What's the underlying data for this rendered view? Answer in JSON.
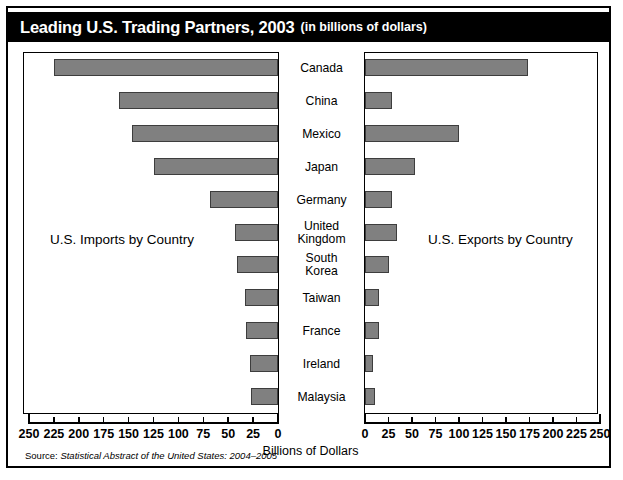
{
  "title": {
    "main": "Leading U.S. Trading Partners, 2003",
    "sub": "(in billions of dollars)"
  },
  "captions": {
    "imports": "U.S. Imports by Country",
    "exports": "U.S. Exports by Country"
  },
  "axis": {
    "title": "Billions of Dollars",
    "left_ticks": [
      "250",
      "225",
      "200",
      "175",
      "150",
      "125",
      "100",
      "75",
      "50",
      "25",
      "0"
    ],
    "right_ticks": [
      "0",
      "25",
      "50",
      "75",
      "100",
      "125",
      "150",
      "175",
      "200",
      "225",
      "250"
    ]
  },
  "source": {
    "prefix": "Source: ",
    "italic": "Statistical Abstract of the United States: 2004–2005"
  },
  "colors": {
    "bar_fill": "#808080",
    "bar_stroke": "#3d3d3d",
    "title_bg": "#000000",
    "title_fg": "#ffffff",
    "frame": "#000000"
  },
  "chart_data": {
    "type": "bar",
    "orientation": "horizontal-diverging",
    "title": "Leading U.S. Trading Partners, 2003 (in billions of dollars)",
    "xlabel": "Billions of Dollars",
    "ylabel": "",
    "xlim": [
      0,
      250
    ],
    "grid": false,
    "legend": "none",
    "categories": [
      "Canada",
      "China",
      "Mexico",
      "Japan",
      "Germany",
      "United Kingdom",
      "South Korea",
      "Taiwan",
      "France",
      "Ireland",
      "Malaysia"
    ],
    "series": [
      {
        "name": "U.S. Imports by Country",
        "side": "left",
        "values": [
          225,
          160,
          147,
          125,
          68,
          43,
          41,
          33,
          32,
          28,
          27
        ]
      },
      {
        "name": "U.S. Exports by Country",
        "side": "right",
        "values": [
          173,
          29,
          100,
          53,
          29,
          34,
          25,
          15,
          15,
          8,
          11
        ]
      }
    ]
  }
}
